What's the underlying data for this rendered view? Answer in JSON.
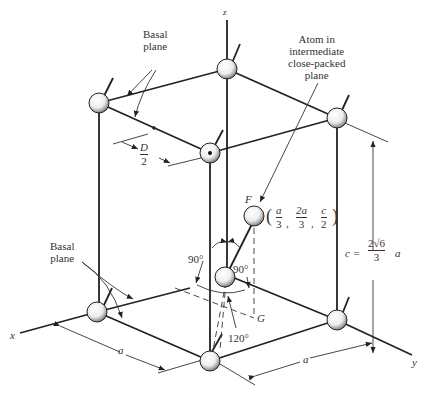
{
  "figure": {
    "axes": {
      "x": "x",
      "y": "y",
      "z": "z"
    },
    "labels": {
      "basal_plane_top": [
        "Basal",
        "plane"
      ],
      "basal_plane_bottom": [
        "Basal",
        "plane"
      ],
      "intermediate_atom": [
        "Atom in",
        "intermediate",
        "close-packed",
        "plane"
      ],
      "D_over_2": {
        "num": "D",
        "den": "2"
      },
      "point_F": "F",
      "point_G": "G",
      "F_coords": {
        "open": "(",
        "x_num": "a",
        "x_den": "3",
        "y_num": "2a",
        "y_den": "3",
        "z_num": "c",
        "z_den": "2",
        "close": ")"
      },
      "c_formula": {
        "lhs": "c =",
        "num": "2√6",
        "den": "3",
        "rhs": "a"
      },
      "angle_90_left": "90°",
      "angle_90_right": "90°",
      "angle_120": "120°",
      "dim_a_left": "a",
      "dim_a_right": "a"
    },
    "colors": {
      "line": "#222222",
      "atom_fill": "#f4f4f4",
      "atom_shade": "#888888"
    }
  }
}
